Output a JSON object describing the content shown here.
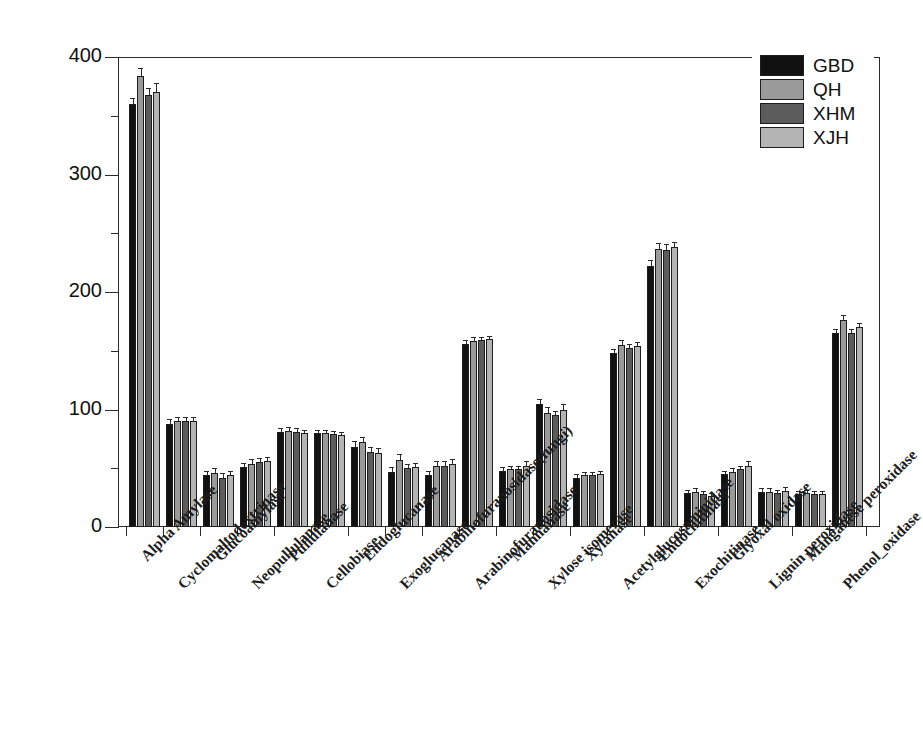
{
  "chart_data": {
    "type": "bar",
    "title": "",
    "xlabel": "",
    "ylabel": "Normalized signal intensity",
    "ylim": [
      0,
      400
    ],
    "ytick_labels": [
      "0",
      "100",
      "200",
      "300",
      "400"
    ],
    "ytick_values": [
      0,
      100,
      200,
      300,
      400
    ],
    "yminor_values": [
      50,
      150,
      250,
      350
    ],
    "grid": false,
    "legend_position": "top-right",
    "orientation": "vertical",
    "categories": [
      "Alpha Amylase",
      "Cyclomaltodextrinase",
      "Glucoamylase",
      "Neopullulanase",
      "Pullulanase",
      "Cellobiase",
      "Endoglucanase",
      "Exoglucanase",
      "Arabinofuranosidase(fungi)",
      "Arabinofuranosidase",
      "Mannanase",
      "Xylose isomerase",
      "Xylanase",
      "Acetylglucosaminidase",
      "Endochitinase",
      "Exochitinase",
      "Glyoxal oxidase",
      "Lignin peroxidase",
      "Manganese peroxidase",
      "Phenol_oxidase"
    ],
    "series": [
      {
        "name": "GBD",
        "color": "#111111",
        "values": [
          360,
          88,
          44,
          51,
          81,
          80,
          68,
          47,
          44,
          156,
          48,
          105,
          42,
          148,
          222,
          29,
          45,
          30,
          28,
          165
        ],
        "errors": [
          4,
          3,
          3,
          3,
          2,
          2,
          4,
          3,
          3,
          2,
          2,
          3,
          2,
          3,
          4,
          2,
          2,
          2,
          2,
          3
        ]
      },
      {
        "name": "QH",
        "color": "#9a9a9a",
        "values": [
          384,
          90,
          46,
          54,
          82,
          80,
          72,
          57,
          52,
          158,
          49,
          97,
          44,
          155,
          237,
          30,
          47,
          30,
          29,
          176
        ],
        "errors": [
          6,
          3,
          3,
          3,
          2,
          2,
          4,
          4,
          3,
          3,
          2,
          4,
          2,
          3,
          4,
          2,
          2,
          2,
          2,
          4
        ]
      },
      {
        "name": "XHM",
        "color": "#5c5c5c",
        "values": [
          368,
          90,
          42,
          55,
          81,
          79,
          64,
          50,
          52,
          159,
          49,
          95,
          44,
          152,
          236,
          28,
          49,
          29,
          28,
          165
        ],
        "errors": [
          5,
          3,
          3,
          3,
          2,
          2,
          3,
          3,
          3,
          2,
          2,
          3,
          2,
          3,
          4,
          2,
          2,
          2,
          2,
          3
        ]
      },
      {
        "name": "XJH",
        "color": "#b4b4b4",
        "values": [
          370,
          90,
          44,
          56,
          80,
          78,
          63,
          51,
          54,
          160,
          52,
          100,
          45,
          154,
          238,
          26,
          52,
          31,
          28,
          170
        ],
        "errors": [
          7,
          3,
          3,
          3,
          2,
          2,
          3,
          3,
          3,
          2,
          3,
          4,
          2,
          3,
          4,
          2,
          3,
          2,
          2,
          3
        ]
      }
    ]
  },
  "legend": {
    "entries": [
      {
        "label": "GBD",
        "swatch": "s0"
      },
      {
        "label": "QH",
        "swatch": "s1"
      },
      {
        "label": "XHM",
        "swatch": "s2"
      },
      {
        "label": "XJH",
        "swatch": "s3"
      }
    ]
  }
}
